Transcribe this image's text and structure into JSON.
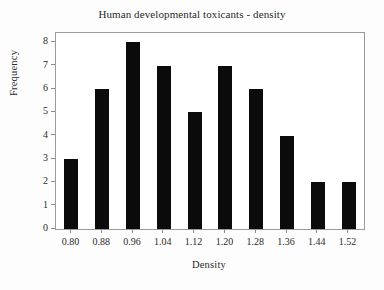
{
  "chart_data": {
    "type": "bar",
    "title": "Human developmental toxicants - density",
    "xlabel": "Density",
    "ylabel": "Frequency",
    "categories": [
      "0.80",
      "0.88",
      "0.96",
      "1.04",
      "1.12",
      "1.20",
      "1.28",
      "1.36",
      "1.44",
      "1.52"
    ],
    "values": [
      3,
      6,
      8,
      7,
      5,
      7,
      6,
      4,
      2,
      2
    ],
    "xtick_labels": [
      "0.80",
      "0.88",
      "0.96",
      "1.04",
      "1.12",
      "1.20",
      "1.28",
      "1.36",
      "1.44",
      "1.52"
    ],
    "ytick_labels": [
      "0",
      "1",
      "2",
      "3",
      "4",
      "5",
      "6",
      "7",
      "8"
    ],
    "ytick_values": [
      0,
      1,
      2,
      3,
      4,
      5,
      6,
      7,
      8
    ],
    "ylim": [
      0,
      8.4
    ],
    "xlim": [
      0.76,
      1.56
    ],
    "grid": false,
    "legend": null,
    "bar_color": "#0b0b0b",
    "axis_color": "#9a9a9a",
    "background_color": "#fdfdfd",
    "plot_background_color": "#ffffff"
  }
}
